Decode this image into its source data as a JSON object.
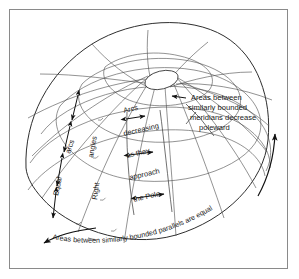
{
  "figure": {
    "background_color": "#ffffff",
    "border_color": "#8a8a8a",
    "line_color": "#4a4a4a",
    "text_color": "#1a1a1a"
  },
  "annotations": {
    "meridian_callout": {
      "lines": [
        "Areas between",
        "similarly bounded",
        "meridians decrease",
        "poleward"
      ]
    },
    "center_column": {
      "lines": [
        "Arcs",
        "decreasing",
        "as they",
        "approach",
        "the Pole"
      ]
    },
    "left_meridian": {
      "line1": "Equal",
      "line2": "arcs"
    },
    "right_angles": {
      "line1": "Right",
      "line2": "angles"
    },
    "bottom_arc": {
      "text": "Areas between similarly bounded parallels are equal"
    }
  },
  "elements": {
    "pole_label": "pole",
    "sphere_label": "globe-wireframe"
  }
}
